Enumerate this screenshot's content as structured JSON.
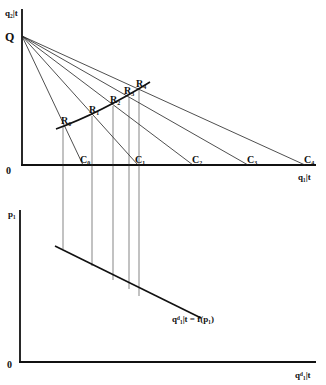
{
  "top_panel": {
    "y_axis_label": "q₂|t",
    "x_axis_label": "q₁|t",
    "origin_label": "0",
    "intercept_label": "Q",
    "c_labels": [
      "C₀",
      "C₁",
      "C₂",
      "C₃",
      "C₄"
    ],
    "r_labels": [
      "R₀",
      "R₁",
      "R₂",
      "R₃",
      "R₄"
    ]
  },
  "bottom_panel": {
    "y_axis_label": "p₁",
    "x_axis_label": "qᵈ₁|t",
    "origin_label": "0",
    "demand_label": "qᵈ₁|t = f(p₁)"
  },
  "colors": {
    "ink": "#111111",
    "background": "#ffffff"
  }
}
